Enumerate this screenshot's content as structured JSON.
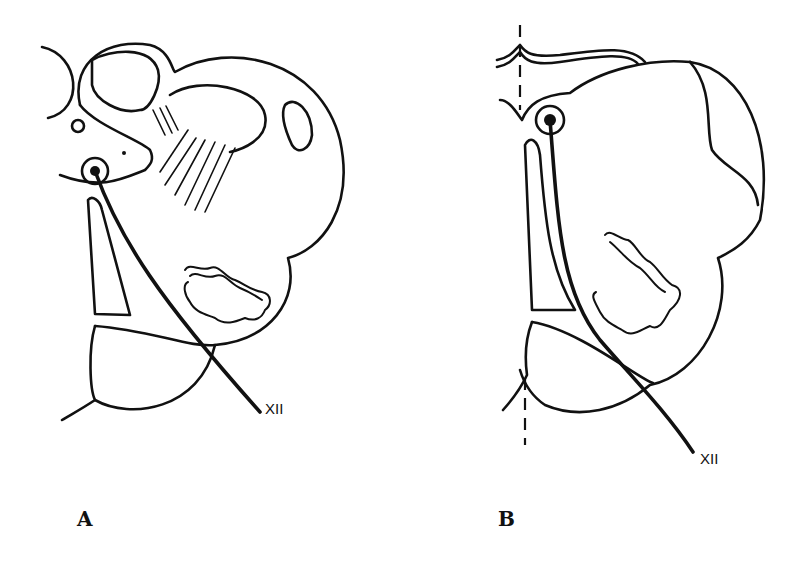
{
  "figure": {
    "panels": [
      {
        "id": "A",
        "label": "A",
        "nerve_label": "XII"
      },
      {
        "id": "B",
        "label": "B",
        "nerve_label": "XII"
      }
    ],
    "colors": {
      "line": "#111111",
      "background": "#ffffff"
    }
  }
}
